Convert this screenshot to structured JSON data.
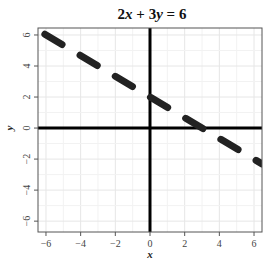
{
  "chart_data": {
    "type": "line",
    "title": "2x + 3y = 6",
    "title_parts": [
      {
        "text": "2",
        "italic": false
      },
      {
        "text": "x",
        "italic": true
      },
      {
        "text": " + 3",
        "italic": false
      },
      {
        "text": "y",
        "italic": true
      },
      {
        "text": " = 6",
        "italic": false
      }
    ],
    "xlabel": "x",
    "ylabel": "y",
    "xlim": [
      -6.46,
      6.46
    ],
    "ylim": [
      -6.7,
      6.45
    ],
    "xticks": [
      -6,
      -4,
      -2,
      0,
      2,
      4,
      6
    ],
    "yticks": [
      -6,
      -4,
      -2,
      0,
      2,
      4,
      6
    ],
    "xtick_labels": [
      "−6",
      "−4",
      "−2",
      "0",
      "2",
      "4",
      "6"
    ],
    "ytick_labels": [
      "−6",
      "−4",
      "−2",
      "0",
      "2",
      "4",
      "6"
    ],
    "grid": true,
    "minor_grid": true,
    "series": [
      {
        "name": "2x + 3y = 6",
        "equation": "y = 2 - (2/3)x",
        "slope": -0.6667,
        "intercept": 2,
        "style": "dashed",
        "color": "#222222",
        "x": [
          -6.46,
          6.46
        ],
        "y": [
          6.31,
          -2.31
        ]
      }
    ],
    "reference_lines": [
      {
        "type": "horizontal",
        "y": 0,
        "color": "#000000"
      },
      {
        "type": "vertical",
        "x": 0,
        "color": "#000000"
      }
    ]
  },
  "colors": {
    "line": "#222222",
    "axes": "#000000",
    "grid": "#ebebeb",
    "frame": "#555555"
  }
}
